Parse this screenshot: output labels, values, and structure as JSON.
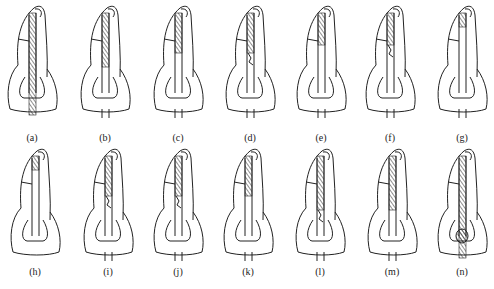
{
  "figure": {
    "panels": [
      {
        "id": "a",
        "label": "(a)",
        "cx": 32,
        "row": 0,
        "fill": "full-post",
        "canal": "none"
      },
      {
        "id": "b",
        "label": "(b)",
        "cx": 105,
        "row": 0,
        "fill": "hatch-to-cervical",
        "canal": "open"
      },
      {
        "id": "c",
        "label": "(c)",
        "cx": 178,
        "row": 0,
        "fill": "hatch-upper",
        "canal": "open"
      },
      {
        "id": "d",
        "label": "(d)",
        "cx": 250,
        "row": 0,
        "fill": "hatch-upper-broken",
        "canal": "open"
      },
      {
        "id": "e",
        "label": "(e)",
        "cx": 321,
        "row": 0,
        "fill": "hatch-short",
        "canal": "open"
      },
      {
        "id": "f",
        "label": "(f)",
        "cx": 390,
        "row": 0,
        "fill": "hatch-short-blob",
        "canal": "open"
      },
      {
        "id": "g",
        "label": "(g)",
        "cx": 462,
        "row": 0,
        "fill": "hatch-tip",
        "canal": "open"
      },
      {
        "id": "h",
        "label": "(h)",
        "cx": 35,
        "row": 1,
        "fill": "hatch-tip",
        "canal": "closed"
      },
      {
        "id": "i",
        "label": "(i)",
        "cx": 108,
        "row": 1,
        "fill": "hatch-upper-broken",
        "canal": "open"
      },
      {
        "id": "j",
        "label": "(j)",
        "cx": 178,
        "row": 1,
        "fill": "hatch-upper-broken",
        "canal": "open"
      },
      {
        "id": "k",
        "label": "(k)",
        "cx": 248,
        "row": 1,
        "fill": "hatch-upper",
        "canal": "open"
      },
      {
        "id": "l",
        "label": "(l)",
        "cx": 320,
        "row": 1,
        "fill": "hatch-to-cervical-broken",
        "canal": "open"
      },
      {
        "id": "m",
        "label": "(m)",
        "cx": 392,
        "row": 1,
        "fill": "hatch-to-cervical",
        "canal": "open"
      },
      {
        "id": "n",
        "label": "(n)",
        "cx": 462,
        "row": 1,
        "fill": "full-post-bulb",
        "canal": "none"
      }
    ]
  },
  "colors": {
    "line": "#222222",
    "background": "#ffffff"
  }
}
